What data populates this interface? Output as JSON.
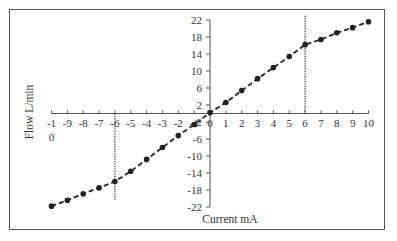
{
  "chart_data": {
    "type": "line",
    "title": "",
    "xlabel": "Current  mA",
    "ylabel": "Flow   L/min",
    "xlim": [
      -10,
      10
    ],
    "ylim": [
      -22,
      22
    ],
    "x_ticks": [
      -10,
      -9,
      -8,
      -7,
      -6,
      -5,
      -4,
      -3,
      -2,
      -1,
      0,
      1,
      2,
      3,
      4,
      5,
      6,
      7,
      8,
      9,
      10
    ],
    "x_tick_labels": [
      "-1\n0",
      "-9",
      "-8",
      "-7",
      "-6",
      "-5",
      "-4",
      "-3",
      "-2",
      "-1",
      "0",
      "1",
      "2",
      "3",
      "4",
      "5",
      "6",
      "7",
      "8",
      "9",
      "10"
    ],
    "y_ticks": [
      22,
      18,
      14,
      10,
      6,
      2,
      -2,
      -6,
      -10,
      -14,
      -18,
      -22
    ],
    "grid": false,
    "legend": null,
    "series": [
      {
        "name": "Flow",
        "style": "dashed line with circle markers",
        "color": "#222222",
        "x": [
          -10,
          -9,
          -8,
          -7,
          -6,
          -5,
          -4,
          -3,
          -2,
          -1,
          0,
          1,
          2,
          3,
          4,
          5,
          6,
          7,
          8,
          9,
          10
        ],
        "y": [
          -21.8,
          -20.4,
          -18.9,
          -17.5,
          -16.0,
          -13.6,
          -10.8,
          -8.0,
          -5.2,
          -2.6,
          0.2,
          2.6,
          5.4,
          8.2,
          10.8,
          13.4,
          16.2,
          17.4,
          19.0,
          20.2,
          21.6
        ]
      }
    ],
    "annotations": [
      {
        "type": "vline",
        "x": -6,
        "style": "dotted",
        "y_from": -20.5,
        "y_to": 0
      },
      {
        "type": "vline",
        "x": 6,
        "style": "dotted",
        "y_from": 0,
        "y_to": 23
      }
    ]
  }
}
